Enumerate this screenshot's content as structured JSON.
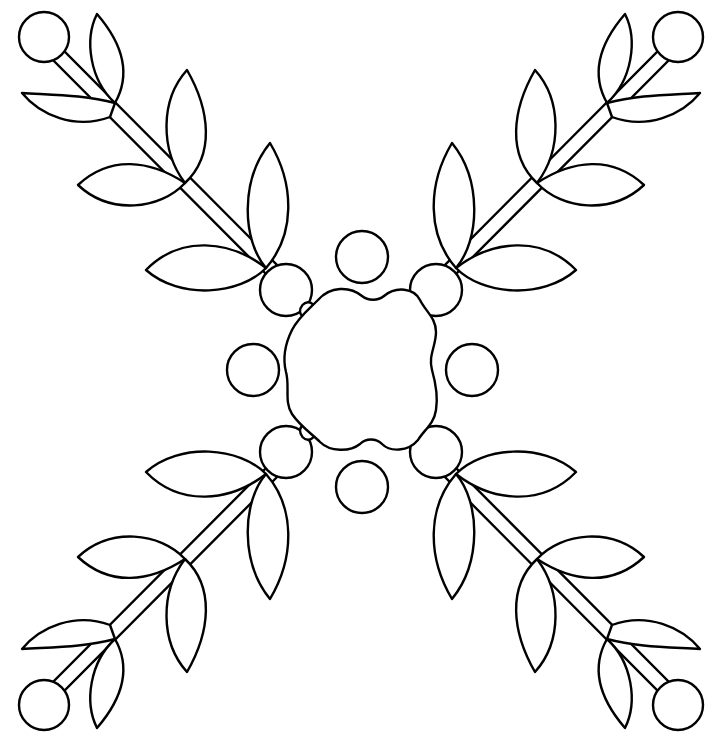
{
  "artwork": {
    "title": "Floral snowflake coloring page",
    "stroke_color": "#000000",
    "fill_color": "#ffffff",
    "background": "#ffffff"
  }
}
